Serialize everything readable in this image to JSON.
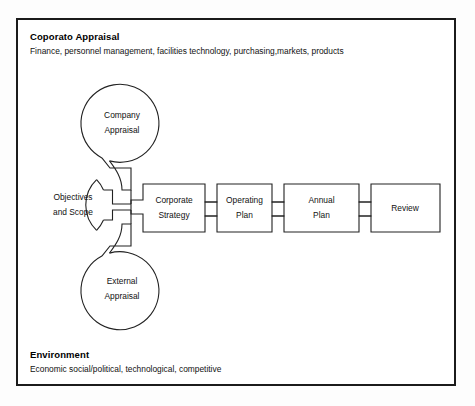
{
  "figure": {
    "type": "process-flow-diagram",
    "frame": {
      "border_color": "#1b1b1b",
      "background": "#ffffff"
    },
    "line_color": "#222222",
    "text_color": "#111111"
  },
  "header": {
    "title": "Coporato Appraisal",
    "subtitle": "Finance, personnel management, facilities technology, purchasing,markets, products"
  },
  "footer": {
    "title": "Environment",
    "subtitle": "Economic social/political, technological, competitive"
  },
  "circles": [
    {
      "id": "company-appraisal",
      "line1": "Company",
      "line2": "Appraisal",
      "cx": 122,
      "cy": 124,
      "r": 39
    },
    {
      "id": "objectives-and-scope",
      "line1": "Objectives",
      "line2": "and Scope",
      "cx": 73,
      "cy": 205,
      "r": 35
    },
    {
      "id": "external-appraisal",
      "line1": "External",
      "line2": "Appraisal",
      "cx": 122,
      "cy": 290,
      "r": 39
    }
  ],
  "stages": [
    {
      "id": "corporate-strategy",
      "line1": "Corporate",
      "line2": "Strategy"
    },
    {
      "id": "operating-plan",
      "line1": "Operating",
      "line2": "Plan"
    },
    {
      "id": "annual-plan",
      "line1": "Annual",
      "line2": "Plan"
    },
    {
      "id": "review",
      "line1": "Review",
      "line2": ""
    }
  ]
}
